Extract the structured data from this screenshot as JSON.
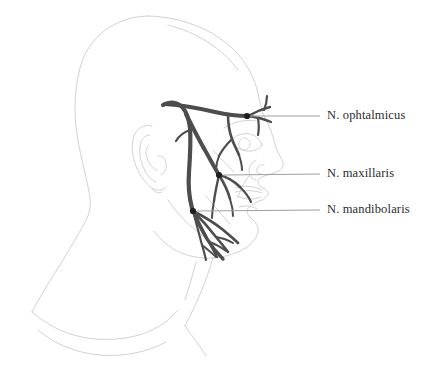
{
  "figure": {
    "background_color": "#ffffff",
    "outline_color": "#d3d3d3",
    "nerve_color": "#4a4a4a",
    "leader_color": "#9a9a9a",
    "text_color": "#2b2b2b",
    "width": 436,
    "height": 378
  },
  "labels": {
    "ophtalmicus": "N. ophtalmicus",
    "maxillaris": "N. maxillaris",
    "mandibolaris": "N. mandibolaris"
  },
  "annotations": [
    {
      "name": "ophtalmicus",
      "text": "N. ophtalmicus",
      "marker_x": 247,
      "marker_y": 116,
      "leader_start_x": 250,
      "leader_start_y": 116,
      "leader_end_x": 320,
      "leader_end_y": 116
    },
    {
      "name": "maxillaris",
      "text": "N. maxillaris",
      "marker_x": 219,
      "marker_y": 175,
      "leader_start_x": 223,
      "leader_start_y": 175,
      "leader_end_x": 320,
      "leader_end_y": 174
    },
    {
      "name": "mandibolaris",
      "text": "N. mandibolaris",
      "marker_x": 193,
      "marker_y": 211,
      "leader_start_x": 197,
      "leader_start_y": 211,
      "leader_end_x": 320,
      "leader_end_y": 210
    }
  ],
  "anatomy_parts": [
    "head-outline",
    "ear",
    "eye",
    "nose",
    "lips",
    "chin",
    "neck",
    "shoulder"
  ],
  "nerve_parts": [
    "trigeminal-trunk",
    "ophthalmic-division",
    "maxillary-division",
    "mandibular-division"
  ]
}
